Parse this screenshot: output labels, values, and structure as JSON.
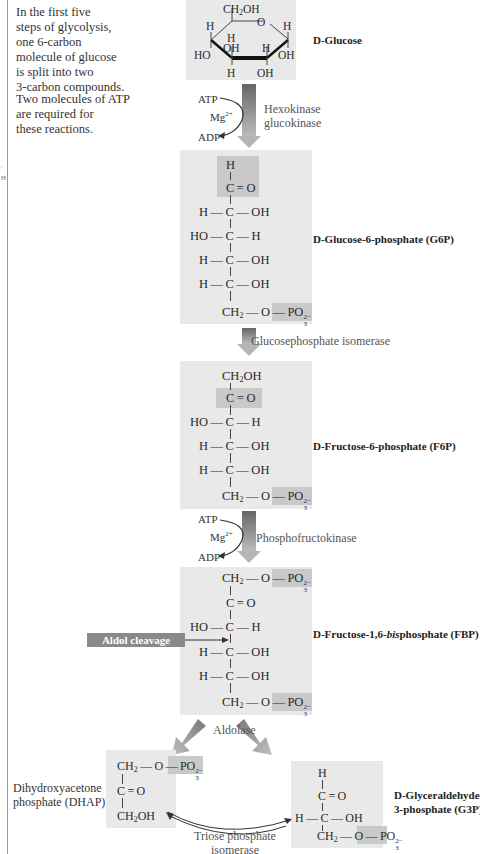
{
  "intro": {
    "paragraph1": [
      "In the first five",
      "steps of glycolysis,",
      "one 6-carbon",
      "molecule of glucose",
      "is split into two",
      "3-carbon compounds."
    ],
    "paragraph2": [
      "Two molecules of ATP",
      "are required for",
      "these reactions."
    ]
  },
  "margin_marks": [
    "⁄",
    "H"
  ],
  "molecules": {
    "glucose": {
      "name_prefix": "D",
      "name": "-Glucose",
      "ring": {
        "top": "CH2OH",
        "ring_o": "O",
        "left_h": "H",
        "right_h": "H",
        "inner_h": "H",
        "inner_oh": "OH",
        "inner_h2": "H",
        "left_ho": "HO",
        "right_oh": "OH",
        "bottom_h": "H",
        "bottom_oh": "OH"
      }
    },
    "g6p": {
      "name_prefix": "D",
      "name": "-Glucose-6-phosphate (G6P)",
      "rows": [
        "H",
        "C = O",
        "H — C — OH",
        "HO — C — H",
        "H — C — OH",
        "H — C — OH"
      ],
      "bottom": "CH2—O—PO3 2−"
    },
    "f6p": {
      "name_prefix": "D",
      "name": "-Fructose-6-phosphate (F6P)",
      "rows": [
        "CH2OH",
        "C = O",
        "HO — C — H",
        "H — C — OH",
        "H — C — OH"
      ],
      "bottom": "CH2—O—PO3 2−"
    },
    "fbp": {
      "name_prefix": "D",
      "name_part1": "-Fructose-1,6-",
      "name_italic": "bis",
      "name_part2": "phosphate (FBP)",
      "top": "CH2—O—PO3 2−",
      "rows": [
        "C = O",
        "HO — C — H",
        "H — C — OH",
        "H — C — OH"
      ],
      "bottom": "CH2—O—PO3 2−"
    },
    "dhap": {
      "name_line1": "Dihydroxyacetone",
      "name_line2": "phosphate (DHAP)",
      "top": "CH2—O—PO3 2−",
      "middle": "C = O",
      "bottom": "CH2OH"
    },
    "g3p": {
      "name_prefix": "D",
      "name_line1": "-Glyceraldehyde-",
      "name_line2": "3-phosphate (G3P)",
      "rows": [
        "H",
        "C = O",
        "H — C — OH"
      ],
      "bottom": "CH2—O—PO3 2−"
    }
  },
  "reactions": {
    "step1": {
      "enzyme_line1": "Hexokinase",
      "enzyme_line2": "glucokinase",
      "atp": "ATP",
      "mg": "Mg",
      "mg_charge": "2+",
      "adp": "ADP"
    },
    "step2": {
      "enzyme": "Glucosephosphate isomerase"
    },
    "step3": {
      "enzyme": "Phosphofructokinase",
      "atp": "ATP",
      "mg": "Mg",
      "mg_charge": "2+",
      "adp": "ADP"
    },
    "step4": {
      "enzyme": "Aldolase",
      "annotation": "Aldol cleavage"
    },
    "step5": {
      "enzyme_line1": "Triose phosphate",
      "enzyme_line2": "isomerase"
    }
  },
  "colors": {
    "box": "#e9e9e9",
    "highlight": "#c9c9c9",
    "arrow_dark": "#666666",
    "arrow_light": "#bbbbbb",
    "aldol_badge": "#8a8a8a"
  }
}
